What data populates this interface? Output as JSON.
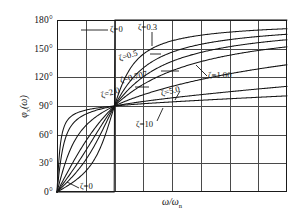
{
  "chart_data": {
    "type": "line",
    "title": "",
    "xlabel": "ω/ωn",
    "ylabel": "φx(ω)",
    "xlim": [
      0,
      4
    ],
    "ylim": [
      0,
      180
    ],
    "xticks": [
      0,
      0.5,
      1.0,
      1.5,
      2.0,
      2.5,
      3.0,
      3.5,
      4.0
    ],
    "yticks": [
      0,
      30,
      60,
      90,
      120,
      150,
      180
    ],
    "ytick_labels": [
      "0°",
      "30°",
      "60°",
      "90°",
      "120°",
      "150°",
      "180°"
    ],
    "grid": true,
    "legend": "inline-annotations",
    "x": [
      0,
      0.1,
      0.2,
      0.3,
      0.4,
      0.5,
      0.6,
      0.7,
      0.8,
      0.9,
      1.0,
      1.1,
      1.2,
      1.4,
      1.6,
      1.8,
      2.0,
      2.4,
      2.8,
      3.2,
      3.6,
      4.0
    ],
    "series": [
      {
        "name": "ζ=0",
        "zeta": 0,
        "values": [
          0,
          0,
          0,
          0,
          0,
          0,
          0,
          0,
          0,
          0,
          90,
          180,
          180,
          180,
          180,
          180,
          180,
          180,
          180,
          180,
          180,
          180
        ]
      },
      {
        "name": "ζ=0.3",
        "zeta": 0.3,
        "values": [
          0,
          3.5,
          7.1,
          11.2,
          16.0,
          21.8,
          29.4,
          39.6,
          53.6,
          71.6,
          90,
          105.2,
          116.3,
          131.0,
          139.4,
          144.8,
          148.4,
          153.3,
          156.4,
          158.6,
          160.2,
          161.5
        ]
      },
      {
        "name": "ζ=0.5",
        "zeta": 0.5,
        "values": [
          0,
          5.8,
          11.8,
          18.2,
          25.5,
          33.7,
          43.2,
          54.2,
          66.8,
          79.9,
          90,
          98.0,
          104.0,
          112.6,
          118.1,
          122.0,
          124.9,
          129.0,
          131.9,
          134.0,
          135.6,
          136.9
        ]
      },
      {
        "name": "ζ=0.707",
        "zeta": 0.707,
        "values": [
          0,
          8.2,
          16.6,
          25.4,
          34.6,
          43.8,
          52.8,
          61.2,
          68.7,
          75.0,
          90,
          93.0,
          96.8,
          104.1,
          109.6,
          113.7,
          116.9,
          121.5,
          124.7,
          127.1,
          128.9,
          130.3
        ]
      },
      {
        "name": "ζ=1.00",
        "zeta": 1.0,
        "values": [
          0,
          11.5,
          23.2,
          33.4,
          43.6,
          53.1,
          61.6,
          69.0,
          75.4,
          83.0,
          90,
          96.0,
          101.3,
          110.0,
          116.6,
          121.6,
          125.5,
          131.2,
          135.2,
          138.1,
          140.4,
          142.2
        ]
      },
      {
        "name": "ζ=2.0",
        "zeta": 2.0,
        "values": [
          0,
          22.0,
          39.8,
          52.8,
          62.2,
          69.1,
          74.2,
          78.2,
          81.4,
          86.0,
          90,
          93.6,
          96.8,
          102.2,
          106.5,
          110.0,
          112.9,
          117.4,
          120.7,
          123.3,
          125.3,
          127.0
        ]
      },
      {
        "name": "ζ=5.0",
        "zeta": 5.0,
        "values": [
          0,
          45.2,
          64.0,
          73.0,
          78.1,
          81.5,
          83.9,
          85.8,
          87.3,
          88.8,
          90,
          91.2,
          92.4,
          94.7,
          96.8,
          98.8,
          100.6,
          103.8,
          106.6,
          109.0,
          111.1,
          113.0
        ]
      },
      {
        "name": "ζ=10",
        "zeta": 10.0,
        "values": [
          0,
          63.4,
          76.0,
          81.2,
          84.0,
          85.6,
          86.8,
          87.7,
          88.4,
          89.2,
          90,
          90.8,
          91.6,
          93.1,
          94.5,
          95.9,
          97.2,
          99.6,
          101.9,
          104.0,
          106.0,
          107.8
        ]
      }
    ],
    "annotations": [
      {
        "id": "zeta-0-top",
        "text": "ζ=0"
      },
      {
        "id": "zeta-0-3",
        "text": "ζ=0.3"
      },
      {
        "id": "zeta-0-5",
        "text": "ζ=0.5"
      },
      {
        "id": "zeta-0-707",
        "text": "ζ=0.707"
      },
      {
        "id": "zeta-1-00",
        "text": "ζ=1.00"
      },
      {
        "id": "zeta-2-0",
        "text": "ζ=2.0"
      },
      {
        "id": "zeta-5-0",
        "text": "ζ=5.0"
      },
      {
        "id": "zeta-10",
        "text": "ζ=10"
      },
      {
        "id": "zeta-0-bottom",
        "text": "ζ=0"
      }
    ]
  },
  "axis": {
    "y_labels": [
      "180°",
      "150°",
      "120°",
      "90°",
      "60°",
      "30°",
      "0°"
    ],
    "y_title_main": "φ",
    "y_title_sub": "x",
    "y_title_tail": "(ω)",
    "x_title_main": "ω/ω",
    "x_title_sub": "n"
  }
}
